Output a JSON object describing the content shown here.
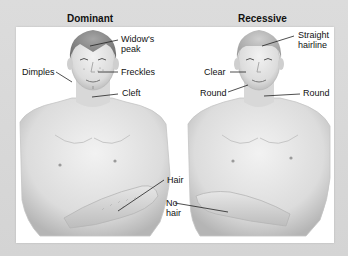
{
  "figure": {
    "left_title": "Dominant",
    "right_title": "Recessive",
    "dominant_labels": {
      "widows_peak_line1": "Widow's",
      "widows_peak_line2": "peak",
      "dimples": "Dimples",
      "freckles": "Freckles",
      "cleft": "Cleft",
      "hair": "Hair"
    },
    "recessive_labels": {
      "straight_hairline_line1": "Straight",
      "straight_hairline_line2": "hairline",
      "clear": "Clear",
      "round_cheek": "Round",
      "round_chin": "Round",
      "no_hair_line1": "No",
      "no_hair_line2": "hair"
    },
    "colors": {
      "background": "#d9d9d9",
      "panel": "#ffffff",
      "skin_light": "#ececec",
      "skin_shade": "#b9b9b9",
      "hair": "#8a8a8a",
      "leader_line": "#222222"
    }
  }
}
